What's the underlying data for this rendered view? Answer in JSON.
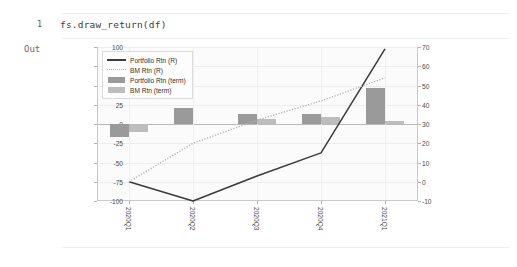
{
  "notebook": {
    "line_number": "1",
    "code": "fs.draw_return(df)",
    "out_label": "Out"
  },
  "chart_data": {
    "type": "bar",
    "title": "",
    "xlabel": "",
    "ylabel": "",
    "categories": [
      "2020Q1",
      "2020Q2",
      "2020Q3",
      "2020Q4",
      "2021Q1"
    ],
    "left_axis": {
      "ticks": [
        "100",
        "75",
        "50",
        "25",
        "0",
        "-25",
        "-50",
        "-75",
        "-100"
      ],
      "ylim": [
        -100,
        100
      ]
    },
    "right_axis": {
      "ticks": [
        "70",
        "60",
        "50",
        "40",
        "30",
        "20",
        "10",
        "0",
        "-10"
      ],
      "ylim": [
        -10,
        70
      ]
    },
    "grid": true,
    "legend_position": "upper left",
    "series": [
      {
        "name": "Portfolio Rtn (R)",
        "kind": "line",
        "style": "solid",
        "axis": "right",
        "color": "#3b3b3b",
        "values": [
          0,
          -10,
          3,
          15,
          69
        ]
      },
      {
        "name": "BM Rtn (R)",
        "kind": "line",
        "style": "dotted",
        "axis": "right",
        "color": "#b0b0b0",
        "values": [
          0,
          20,
          32,
          42,
          54
        ]
      },
      {
        "name": "Portfolio Rtn (term)",
        "kind": "bar",
        "axis": "left",
        "color": "#9a9a9a",
        "values": [
          -17,
          21,
          13,
          13,
          47
        ]
      },
      {
        "name": "BM Rtn (term)",
        "kind": "bar",
        "axis": "left",
        "color": "#bdbdbd",
        "values": [
          -11,
          0,
          6,
          9,
          4
        ]
      }
    ]
  }
}
